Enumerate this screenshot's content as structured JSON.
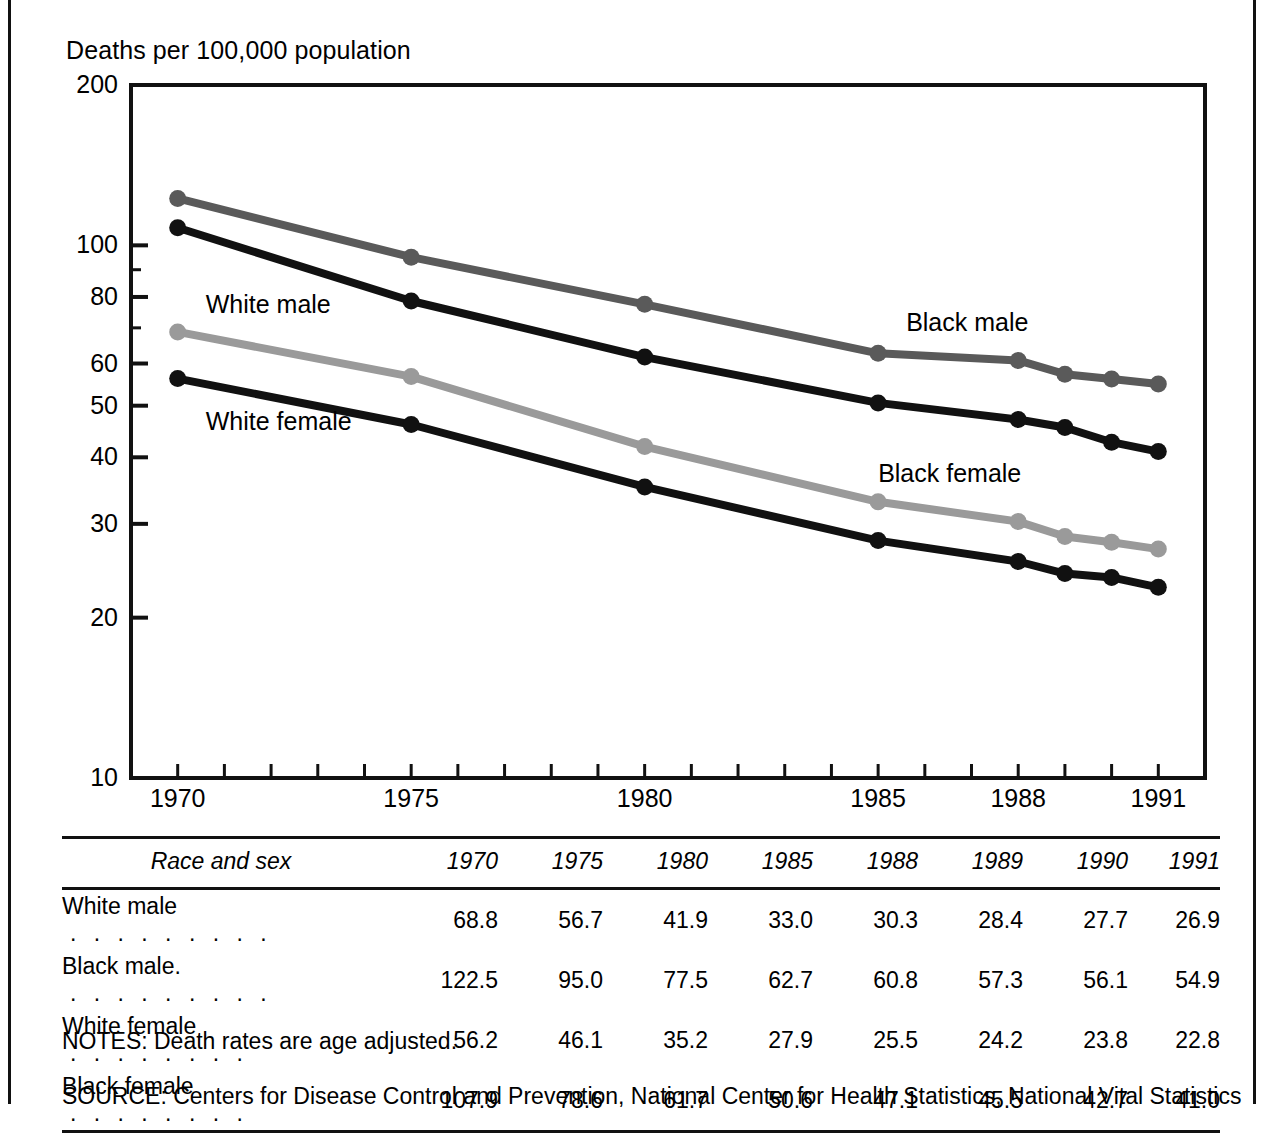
{
  "chart_data": {
    "type": "line",
    "title": "",
    "ylabel": "Deaths per 100,000 population",
    "xlabel": "",
    "x": [
      1970,
      1975,
      1980,
      1985,
      1988,
      1989,
      1990,
      1991
    ],
    "xtick_labels": [
      "1970",
      "1975",
      "1980",
      "1985",
      "1988",
      "1991"
    ],
    "xtick_values": [
      1970,
      1975,
      1980,
      1985,
      1988,
      1991
    ],
    "xlim": [
      1969,
      1992
    ],
    "yscale": "log",
    "ylim": [
      10,
      200
    ],
    "ytick_labels": [
      "10",
      "20",
      "30",
      "40",
      "50",
      "60",
      "80",
      "100",
      "200"
    ],
    "ytick_values": [
      10,
      20,
      30,
      40,
      50,
      60,
      80,
      100,
      200
    ],
    "grid": false,
    "legend": "inline-annotations",
    "series": [
      {
        "name": "White male",
        "color": "#9a9a9a",
        "label_x": 1970.6,
        "label_y": 78,
        "values": [
          68.8,
          56.7,
          41.9,
          33.0,
          30.3,
          28.4,
          27.7,
          26.9
        ]
      },
      {
        "name": "Black male",
        "color": "#5a5a5a",
        "label_x": 1985.6,
        "label_y": 72,
        "values": [
          122.5,
          95.0,
          77.5,
          62.7,
          60.8,
          57.3,
          56.1,
          54.9
        ]
      },
      {
        "name": "White female",
        "color": "#111111",
        "label_x": 1970.6,
        "label_y": 47,
        "values": [
          56.2,
          46.1,
          35.2,
          27.9,
          25.5,
          24.2,
          23.8,
          22.8
        ]
      },
      {
        "name": "Black female",
        "color": "#111111",
        "label_x": 1985.0,
        "label_y": 37.5,
        "values": [
          107.9,
          78.6,
          61.7,
          50.6,
          47.1,
          45.5,
          42.7,
          41.0
        ]
      }
    ]
  },
  "table": {
    "row_header_label": "Race and sex",
    "columns": [
      "1970",
      "1975",
      "1980",
      "1985",
      "1988",
      "1989",
      "1990",
      "1991"
    ],
    "rows": [
      {
        "label": "White male",
        "leader": ". . . . . . . . .",
        "values": [
          "68.8",
          "56.7",
          "41.9",
          "33.0",
          "30.3",
          "28.4",
          "27.7",
          "26.9"
        ]
      },
      {
        "label": "Black male.",
        "leader": ". . . . . . . . .",
        "values": [
          "122.5",
          "95.0",
          "77.5",
          "62.7",
          "60.8",
          "57.3",
          "56.1",
          "54.9"
        ]
      },
      {
        "label": "White female",
        "leader": ". . . . . . . .",
        "values": [
          "56.2",
          "46.1",
          "35.2",
          "27.9",
          "25.5",
          "24.2",
          "23.8",
          "22.8"
        ]
      },
      {
        "label": "Black female",
        "leader": ". . . . . . . .",
        "values": [
          "107.9",
          "78.6",
          "61.7",
          "50.6",
          "47.1",
          "45.5",
          "42.7",
          "41.0"
        ]
      }
    ]
  },
  "footer": {
    "notes": "NOTES: Death rates are age adjusted.",
    "source": "SOURCE: Centers for Disease Control and Prevention, National Center for Health Statistics, National Vital Statistics"
  }
}
